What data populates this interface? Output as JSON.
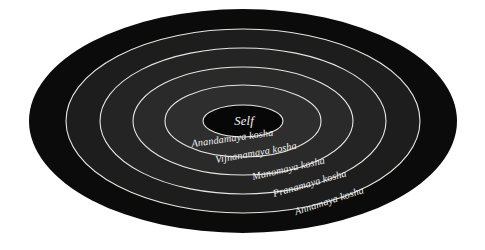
{
  "figure": {
    "name": "pancha-kosha-diagram",
    "background_color": "#ffffff",
    "outline_color": "#d8d8d4",
    "center": {
      "cx": 243,
      "cy": 121
    }
  },
  "core": {
    "label": "Self",
    "fill": "#070707",
    "rx": 40,
    "ry": 16,
    "label_x": 244,
    "label_y": 125
  },
  "rings": [
    {
      "name": "annamaya",
      "label": "Annamaya kosha",
      "fill": "#0b0b0b",
      "rx": 214,
      "ry": 112,
      "label_x": 296,
      "label_y": 215,
      "label_rotation": -18
    },
    {
      "name": "pranamaya",
      "label": "Pranamaya kosha",
      "fill": "#1d1d1d",
      "rx": 177,
      "ry": 92,
      "label_x": 274,
      "label_y": 197,
      "label_rotation": -16
    },
    {
      "name": "manomaya",
      "label": "Manomaya kosha",
      "fill": "#242424",
      "rx": 143,
      "ry": 73,
      "label_x": 253,
      "label_y": 180,
      "label_rotation": -13
    },
    {
      "name": "vijnanamaya",
      "label": "Vijnanamaya kosha",
      "fill": "#2a2a2a",
      "rx": 110,
      "ry": 54,
      "label_x": 216,
      "label_y": 163,
      "label_rotation": -10
    },
    {
      "name": "anandamaya",
      "label": "Anandamaya kosha",
      "fill": "#2e2e2e",
      "rx": 78,
      "ry": 36,
      "label_x": 192,
      "label_y": 147,
      "label_rotation": -8
    }
  ]
}
